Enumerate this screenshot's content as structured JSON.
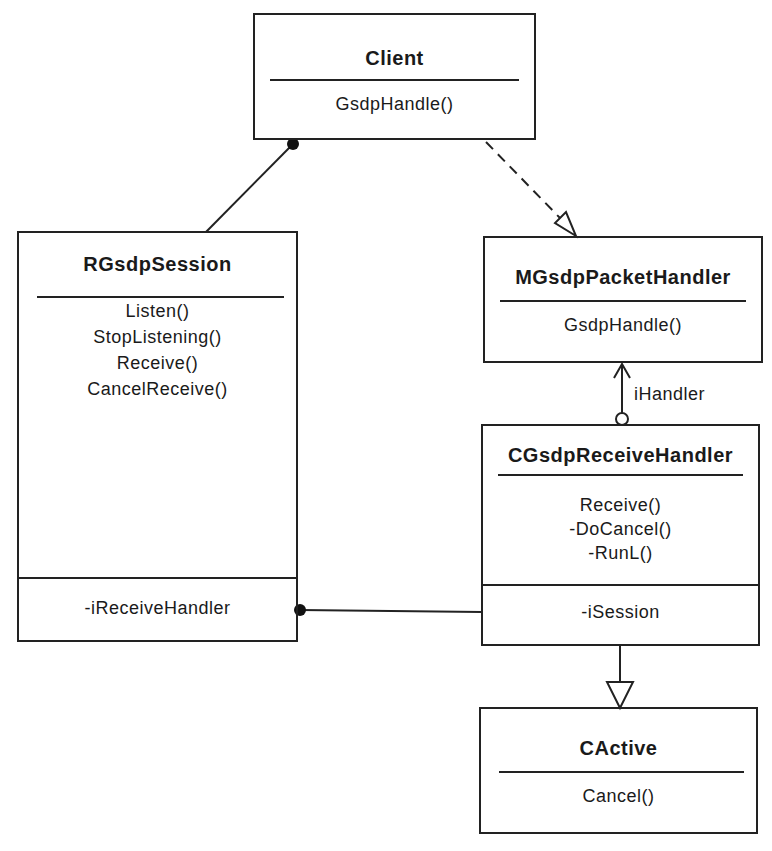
{
  "diagram": {
    "type": "UML class diagram",
    "classes": [
      {
        "id": "client",
        "name": "Client",
        "operations": [
          "GsdpHandle()"
        ],
        "attributes": []
      },
      {
        "id": "rgsdpsession",
        "name": "RGsdpSession",
        "operations": [
          "Listen()",
          "StopListening()",
          "Receive()",
          "CancelReceive()"
        ],
        "attributes": [
          "-iReceiveHandler"
        ]
      },
      {
        "id": "mgsdppackethandler",
        "name": "MGsdpPacketHandler",
        "operations": [
          "GsdpHandle()"
        ],
        "attributes": []
      },
      {
        "id": "cgsdpreceivehandler",
        "name": "CGsdpReceiveHandler",
        "operations": [
          "Receive()",
          "-DoCancel()",
          "-RunL()"
        ],
        "attributes": [
          "-iSession"
        ]
      },
      {
        "id": "cactive",
        "name": "CActive",
        "operations": [
          "Cancel()"
        ],
        "attributes": []
      }
    ],
    "relationships": [
      {
        "from": "Client",
        "to": "RGsdpSession",
        "kind": "association",
        "end_marker": "filled-circle at Client"
      },
      {
        "from": "Client",
        "to": "MGsdpPacketHandler",
        "kind": "realization",
        "style": "dashed",
        "end_marker": "hollow-triangle"
      },
      {
        "from": "CGsdpReceiveHandler",
        "to": "MGsdpPacketHandler",
        "kind": "navigable-association",
        "label": "iHandler",
        "end_marker": "open-arrow + hollow-circle"
      },
      {
        "from": "RGsdpSession",
        "to": "CGsdpReceiveHandler",
        "kind": "association",
        "end_marker": "filled-circle at RGsdpSession"
      },
      {
        "from": "CGsdpReceiveHandler",
        "to": "CActive",
        "kind": "generalization",
        "end_marker": "hollow-triangle"
      }
    ],
    "labels": {
      "ihandler": "iHandler"
    }
  }
}
